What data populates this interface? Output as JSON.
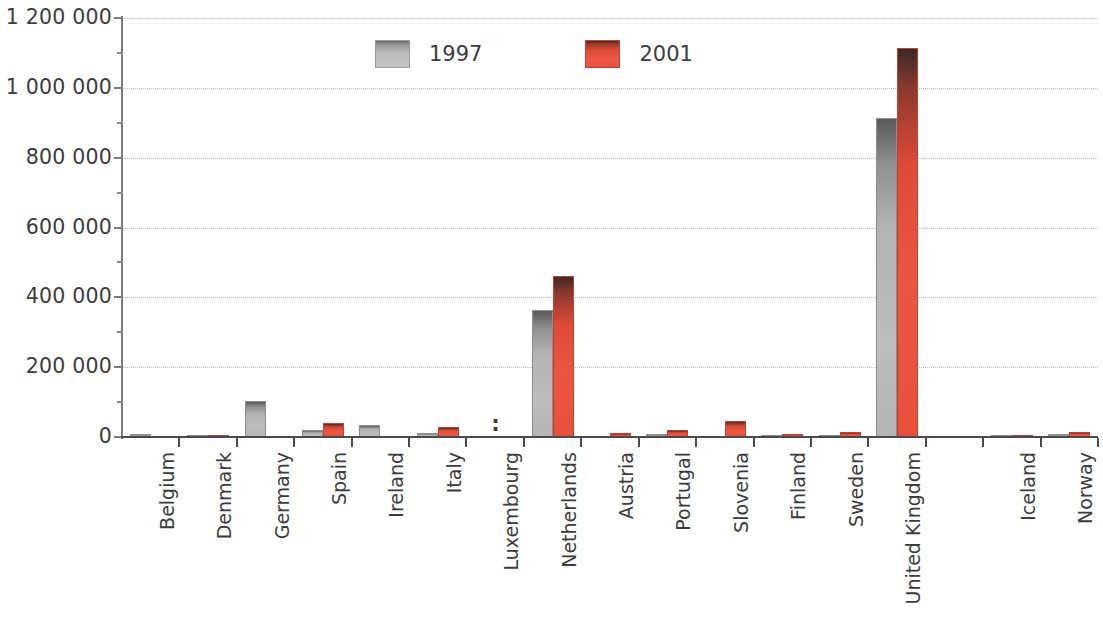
{
  "chart_data": {
    "type": "bar",
    "title": "",
    "subtitle": "",
    "xlabel": "",
    "ylabel": "",
    "ylim": [
      0,
      1200000
    ],
    "grid": true,
    "legend_position": "top-center",
    "y_ticks": [
      "0",
      "200 000",
      "400 000",
      "600 000",
      "800 000",
      "1 000 000",
      "1 200 000"
    ],
    "y_tick_values": [
      0,
      200000,
      400000,
      600000,
      800000,
      1000000,
      1200000
    ],
    "categories": [
      "Belgium",
      "Denmark",
      "Germany",
      "Spain",
      "Ireland",
      "Italy",
      "Luxembourg",
      "Netherlands",
      "Austria",
      "Portugal",
      "Slovenia",
      "Finland",
      "Sweden",
      "United Kingdom",
      "",
      "Iceland",
      "Norway"
    ],
    "series": [
      {
        "name": "1997",
        "color": "#b5b5b5",
        "values": [
          8000,
          3000,
          103000,
          20000,
          35000,
          12000,
          null,
          363000,
          0,
          8000,
          0,
          3000,
          7000,
          913000,
          null,
          1500,
          10000
        ]
      },
      {
        "name": "2001",
        "color": "#e8503c",
        "values": [
          0,
          5000,
          0,
          40000,
          0,
          30000,
          null,
          460000,
          12000,
          20000,
          46000,
          8000,
          13000,
          1113000,
          null,
          1000,
          13000
        ]
      }
    ],
    "not_available_marker": ":",
    "not_available_categories": [
      "Luxembourg"
    ]
  },
  "legend": {
    "items": [
      {
        "label": "1997",
        "swatch": "gray-swatch"
      },
      {
        "label": "2001",
        "swatch": "red-swatch"
      }
    ]
  }
}
